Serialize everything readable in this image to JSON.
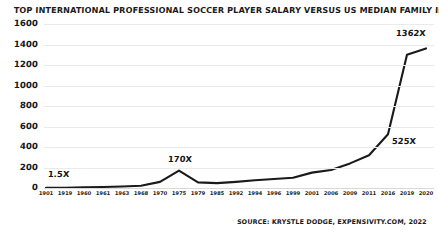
{
  "chart_data": {
    "type": "line",
    "title": "TOP INTERNATIONAL PROFESSIONAL SOCCER PLAYER SALARY VERSUS US MEDIAN FAMILY INCOME, 1901 – 2020",
    "subtitle": "",
    "xlabel": "",
    "ylabel": "",
    "source": "SOURCE: KRYSTLE DODGE, EXPENSIVITY.COM, 2022",
    "grid": true,
    "legend": false,
    "line_color": "#1a1a1a",
    "grid_color": "#eaeaea",
    "ylim": [
      0,
      1600
    ],
    "yticks": [
      0,
      200,
      400,
      600,
      800,
      1000,
      1200,
      1400,
      1600
    ],
    "ytick_labels": [
      "0",
      "200",
      "400",
      "600",
      "800",
      "1000",
      "1200",
      "1400",
      "1600"
    ],
    "categories": [
      "1901",
      "1919",
      "1960",
      "1961",
      "1963",
      "1968",
      "1970",
      "1975",
      "1979",
      "1985",
      "1992",
      "1994",
      "1996",
      "1999",
      "2001",
      "2006",
      "2009",
      "2011",
      "2016",
      "2019",
      "2020"
    ],
    "values": [
      1.5,
      3,
      8,
      10,
      14,
      22,
      60,
      170,
      55,
      48,
      60,
      75,
      88,
      100,
      150,
      175,
      240,
      320,
      525,
      1300,
      1362
    ],
    "annotations": [
      {
        "label": "1.5X",
        "category": "1901",
        "value": 1.5
      },
      {
        "label": "170X",
        "category": "1975",
        "value": 170
      },
      {
        "label": "525X",
        "category": "2016",
        "value": 525
      },
      {
        "label": "1362X",
        "category": "2020",
        "value": 1362
      }
    ]
  }
}
